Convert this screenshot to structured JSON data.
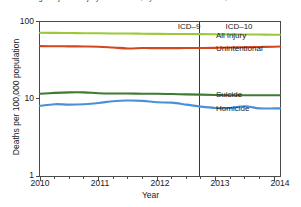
{
  "chart_data": {
    "type": "line",
    "title": "Age-adjusted injury death rates, by intent: United States, 2010–2014",
    "xlabel": "Year",
    "ylabel": "Deaths per 100,000 population",
    "yscale": "log",
    "ylim": [
      1,
      100
    ],
    "xlim": [
      2010,
      2014.1
    ],
    "y_tick_labels": [
      "100",
      "10",
      "1"
    ],
    "y_tick_values": [
      100,
      10,
      1
    ],
    "x_tick_labels": [
      "2010",
      "2011",
      "2012",
      "2013",
      "2014"
    ],
    "x_tick_values": [
      2010,
      2011,
      2012,
      2013,
      2014
    ],
    "minor_ticks_per_year": 4,
    "grid": false,
    "legend_position": "inline-right",
    "annotations": [
      {
        "label": "ICD–9",
        "x": 2011.9
      },
      {
        "label": "ICD–10",
        "x": 2013.35
      }
    ],
    "divider_x": 2012.72,
    "series": [
      {
        "name": "All injury",
        "color": "#9CC93B",
        "x": [
          2010.0,
          2010.25,
          2010.5,
          2010.75,
          2011.0,
          2011.25,
          2011.5,
          2011.75,
          2012.0,
          2012.25,
          2012.5,
          2012.75,
          2013.0,
          2013.25,
          2013.5,
          2013.75,
          2014.0,
          2014.1
        ],
        "values": [
          71.5,
          71.2,
          70.9,
          70.6,
          70.3,
          70.0,
          69.8,
          69.5,
          69.2,
          69.0,
          68.8,
          68.6,
          68.4,
          68.2,
          68.0,
          67.8,
          67.5,
          67.4
        ]
      },
      {
        "name": "Unintentional",
        "color": "#D4461F",
        "x": [
          2010.0,
          2010.25,
          2010.5,
          2010.75,
          2011.0,
          2011.25,
          2011.5,
          2011.75,
          2012.0,
          2012.25,
          2012.5,
          2012.75,
          2013.0,
          2013.25,
          2013.5,
          2013.75,
          2014.0,
          2014.1
        ],
        "values": [
          48.0,
          47.8,
          47.7,
          47.5,
          47.2,
          46.0,
          44.8,
          45.3,
          45.2,
          45.2,
          45.3,
          45.4,
          45.6,
          46.0,
          46.4,
          46.8,
          47.2,
          47.4
        ]
      },
      {
        "name": "Suicide",
        "color": "#3F7A31",
        "x": [
          2010.0,
          2010.25,
          2010.5,
          2010.75,
          2011.0,
          2011.25,
          2011.5,
          2011.75,
          2012.0,
          2012.25,
          2012.5,
          2012.75,
          2013.0,
          2013.25,
          2013.5,
          2013.75,
          2014.0,
          2014.1
        ],
        "values": [
          11.6,
          11.9,
          12.1,
          12.1,
          11.8,
          11.7,
          11.7,
          11.6,
          11.6,
          11.5,
          11.4,
          11.3,
          11.2,
          11.1,
          11.1,
          11.1,
          11.1,
          11.1
        ]
      },
      {
        "name": "Homicide",
        "color": "#4A90D9",
        "x": [
          2010.0,
          2010.25,
          2010.5,
          2010.75,
          2011.0,
          2011.25,
          2011.5,
          2011.75,
          2012.0,
          2012.25,
          2012.5,
          2012.75,
          2013.0,
          2013.25,
          2013.5,
          2013.75,
          2014.0,
          2014.1
        ],
        "values": [
          8.1,
          8.5,
          8.4,
          8.5,
          8.8,
          9.3,
          9.5,
          9.4,
          9.0,
          8.9,
          8.4,
          7.9,
          7.6,
          7.6,
          8.0,
          7.5,
          7.5,
          7.5
        ]
      }
    ]
  },
  "labels": {
    "all_injury": "All injury",
    "unintentional": "Unintentional",
    "suicide": "Suicide",
    "homicide": "Homicide",
    "icd9": "ICD–9",
    "icd10": "ICD–10",
    "y_axis_title": "Deaths per 100,000 population",
    "x_axis_title": "Year",
    "y_100": "100",
    "y_10": "10",
    "y_1": "1",
    "x_2010": "2010",
    "x_2011": "2011",
    "x_2012": "2012",
    "x_2013": "2013",
    "x_2014": "2014"
  }
}
